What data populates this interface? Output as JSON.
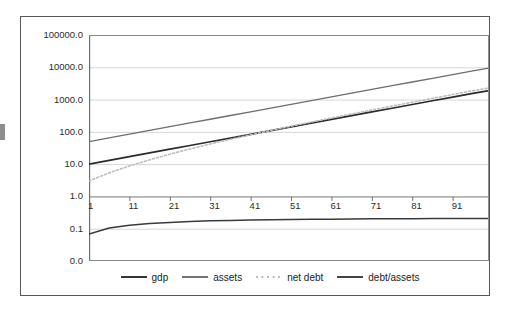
{
  "chart_data": {
    "type": "line",
    "title": "",
    "subtitle": "",
    "xlabel": "",
    "ylabel": "",
    "yscale": "log",
    "ylim": [
      0.03,
      100000.0
    ],
    "xlim": [
      1,
      100
    ],
    "grid": true,
    "legend_position": "bottom",
    "y_ticks": [
      "100000.0",
      "10000.0",
      "1000.0",
      "100.0",
      "10.0",
      "1.0",
      "0.1",
      "0.0"
    ],
    "y_tick_values": [
      100000.0,
      10000.0,
      1000.0,
      100.0,
      10.0,
      1.0,
      0.1,
      0.0
    ],
    "x_ticks": [
      "1",
      "11",
      "21",
      "31",
      "41",
      "51",
      "61",
      "71",
      "81",
      "91"
    ],
    "x_tick_values": [
      1,
      11,
      21,
      31,
      41,
      51,
      61,
      71,
      81,
      91
    ],
    "colors": {
      "gdp": "#2b2b2b",
      "assets": "#6e6e6e",
      "net_debt": "#bdbdbd",
      "debt_assets": "#3a3a3a",
      "grid": "#d6d6d6",
      "axis": "#8a8a8a",
      "frame": "#565656"
    },
    "x": [
      1,
      6,
      11,
      16,
      21,
      26,
      31,
      36,
      41,
      46,
      51,
      56,
      61,
      66,
      71,
      76,
      81,
      86,
      91,
      96,
      100
    ],
    "series": [
      {
        "name": "gdp",
        "style": "solid",
        "values": [
          10.0,
          13.0,
          17.0,
          22.2,
          29.0,
          37.8,
          49.3,
          64.3,
          83.9,
          109.4,
          142.7,
          186.2,
          242.9,
          316.9,
          413.4,
          539.3,
          703.4,
          917.4,
          1196.6,
          1560.9,
          1896.0
        ]
      },
      {
        "name": "assets",
        "style": "solid",
        "values": [
          50.0,
          65.2,
          85.0,
          110.9,
          144.6,
          188.6,
          246.0,
          320.9,
          418.5,
          545.8,
          711.9,
          928.5,
          1210.9,
          1579.3,
          2059.6,
          2686.1,
          3503.4,
          4569.3,
          5959.1,
          7771.2,
          9437.0
        ]
      },
      {
        "name": "net debt",
        "style": "dotted",
        "values": [
          3.0,
          5.4,
          8.8,
          13.6,
          20.4,
          29.6,
          42.1,
          58.8,
          81.0,
          110.5,
          149.5,
          201.0,
          268.8,
          358.0,
          475.0,
          628.2,
          828.5,
          1090.5,
          1432.5,
          1878.9,
          2288.0
        ]
      },
      {
        "name": "debt/assets",
        "style": "solid",
        "values": [
          0.068,
          0.105,
          0.128,
          0.145,
          0.157,
          0.167,
          0.175,
          0.181,
          0.186,
          0.19,
          0.193,
          0.196,
          0.198,
          0.2,
          0.202,
          0.204,
          0.205,
          0.206,
          0.207,
          0.208,
          0.209
        ]
      }
    ]
  },
  "legend": {
    "entries": [
      {
        "label": "gdp",
        "icon": "solid-line-icon"
      },
      {
        "label": "assets",
        "icon": "solid-line-icon"
      },
      {
        "label": "net debt",
        "icon": "dotted-line-icon"
      },
      {
        "label": "debt/assets",
        "icon": "solid-line-icon"
      }
    ]
  }
}
